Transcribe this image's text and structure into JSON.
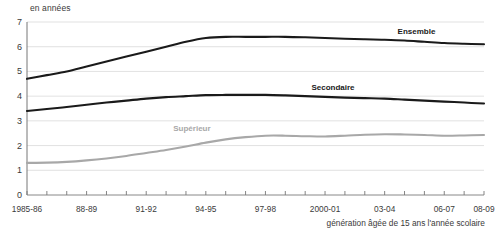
{
  "chart_data": {
    "type": "line",
    "title": "",
    "unit_label": "en années",
    "xlabel": "génération âgée de 15 ans l'année scolaire",
    "ylabel": "",
    "ylim": [
      0,
      7
    ],
    "ytick_values": [
      0,
      1,
      2,
      3,
      4,
      5,
      6,
      7
    ],
    "ytick_labels": [
      "0",
      "1",
      "2",
      "3",
      "4",
      "5",
      "6",
      "7"
    ],
    "grid": true,
    "legend_position": "inline-annotations",
    "x": [
      "1985-86",
      "86-87",
      "87-88",
      "88-89",
      "89-90",
      "90-91",
      "91-92",
      "92-93",
      "93-94",
      "94-95",
      "95-96",
      "96-97",
      "97-98",
      "98-99",
      "99-2000",
      "2000-01",
      "01-02",
      "02-03",
      "03-04",
      "04-05",
      "05-06",
      "06-07",
      "07-08",
      "08-09"
    ],
    "xtick_labels_shown": [
      "1985-86",
      "88-89",
      "91-92",
      "94-95",
      "97-98",
      "2000-01",
      "03-04",
      "06-07",
      "08-09"
    ],
    "series": [
      {
        "name": "Ensemble",
        "color": "#1a1a1a",
        "values": [
          4.7,
          4.85,
          5.0,
          5.2,
          5.4,
          5.6,
          5.8,
          6.0,
          6.2,
          6.35,
          6.4,
          6.4,
          6.4,
          6.4,
          6.38,
          6.35,
          6.32,
          6.3,
          6.28,
          6.25,
          6.2,
          6.15,
          6.12,
          6.1
        ]
      },
      {
        "name": "Secondaire",
        "color": "#1a1a1a",
        "values": [
          3.4,
          3.48,
          3.56,
          3.65,
          3.74,
          3.82,
          3.9,
          3.96,
          4.0,
          4.04,
          4.05,
          4.05,
          4.05,
          4.03,
          4.0,
          3.97,
          3.94,
          3.92,
          3.9,
          3.86,
          3.82,
          3.78,
          3.74,
          3.7
        ]
      },
      {
        "name": "Supérieur",
        "color": "#a8a8a8",
        "values": [
          1.3,
          1.31,
          1.34,
          1.4,
          1.48,
          1.58,
          1.7,
          1.82,
          1.96,
          2.12,
          2.25,
          2.34,
          2.4,
          2.4,
          2.38,
          2.37,
          2.4,
          2.44,
          2.46,
          2.45,
          2.43,
          2.4,
          2.41,
          2.43
        ]
      }
    ],
    "annotations": [
      {
        "text": "Ensemble",
        "x_index": 19.6,
        "y_value": 6.62,
        "color": "#1a1a1a"
      },
      {
        "text": "Secondaire",
        "x_index": 15.4,
        "y_value": 4.38,
        "color": "#1a1a1a"
      },
      {
        "text": "Supérieur",
        "x_index": 8.3,
        "y_value": 2.72,
        "color": "#a8a8a8"
      }
    ]
  }
}
